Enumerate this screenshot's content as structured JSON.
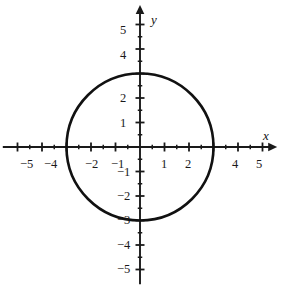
{
  "figure": {
    "background_color": "#ffffff",
    "ink_color": "#1a1a1a",
    "width": 283,
    "height": 288
  },
  "axes": {
    "x_axis_name": "x",
    "y_axis_name": "y",
    "origin_px": {
      "x": 140,
      "y": 147
    },
    "unit_px": 24.5,
    "x_range": [
      -5.6,
      5.6
    ],
    "y_range": [
      -5.6,
      5.8
    ],
    "major_tick_len": 9,
    "minor_tick_len": 4.5,
    "arrowheads": [
      "x-positive",
      "y-positive"
    ]
  },
  "x_ticks": {
    "major_values": [
      -5,
      -4,
      -3,
      -2,
      -1,
      1,
      2,
      3,
      4,
      5
    ],
    "minor_values": [
      -4.5,
      -3.5,
      -2.5,
      -1.5,
      -0.5,
      0.5,
      1.5,
      2.5,
      3.5,
      4.5
    ],
    "labels": [
      {
        "value": -5,
        "text": "−5"
      },
      {
        "value": -4,
        "text": "−4"
      },
      {
        "value": -2,
        "text": "−2"
      },
      {
        "value": -1,
        "text": "−1"
      },
      {
        "value": 1,
        "text": "1"
      },
      {
        "value": 2,
        "text": "2"
      },
      {
        "value": 4,
        "text": "4"
      },
      {
        "value": 5,
        "text": "5"
      }
    ]
  },
  "y_ticks": {
    "major_values": [
      -5,
      -4,
      -3,
      -2,
      -1,
      1,
      2,
      3,
      4,
      5
    ],
    "minor_values": [
      -4.5,
      -3.5,
      -2.5,
      -1.5,
      -0.5,
      0.5,
      1.5,
      2.5,
      3.5,
      4.5
    ],
    "labels": [
      {
        "value": 5,
        "text": "5"
      },
      {
        "value": 4,
        "text": "4"
      },
      {
        "value": 2,
        "text": "2"
      },
      {
        "value": 1,
        "text": "1"
      },
      {
        "value": -1,
        "text": "−1"
      },
      {
        "value": -2,
        "text": "−2"
      },
      {
        "value": -3,
        "text": "−3"
      },
      {
        "value": -4,
        "text": "−4"
      },
      {
        "value": -5,
        "text": "−5"
      }
    ]
  },
  "chart_data": {
    "type": "scatter",
    "title": "",
    "xlabel": "x",
    "ylabel": "y",
    "xlim": [
      -5.6,
      5.6
    ],
    "ylim": [
      -5.6,
      5.8
    ],
    "grid": false,
    "legend": null,
    "xticks": [
      -5,
      -4,
      -3,
      -2,
      -1,
      0,
      1,
      2,
      3,
      4,
      5
    ],
    "yticks": [
      -5,
      -4,
      -3,
      -2,
      -1,
      0,
      1,
      2,
      3,
      4,
      5
    ],
    "xticklabels": [
      "−5",
      "−4",
      "",
      "−2",
      "−1",
      "",
      "1",
      "2",
      "",
      "4",
      "5"
    ],
    "yticklabels": [
      "−5",
      "−4",
      "−3",
      "−2",
      "−1",
      "",
      "1",
      "2",
      "",
      "4",
      "5"
    ],
    "series": [
      {
        "name": "circle",
        "kind": "circle",
        "equation": "x^2 + y^2 = 9",
        "center": [
          0,
          0
        ],
        "radius": 3,
        "stroke": "#111111",
        "stroke_width": 2.6,
        "fill": "none",
        "x_intercepts": [
          -3,
          3
        ],
        "y_intercepts": [
          -3,
          3
        ]
      }
    ]
  }
}
